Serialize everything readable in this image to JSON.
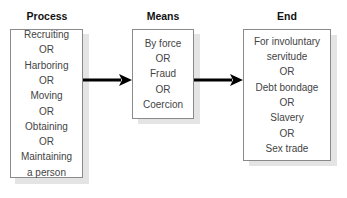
{
  "diagram": {
    "columns": [
      {
        "title": "Process",
        "lines": [
          "Recruiting",
          "OR",
          "Harboring",
          "OR",
          "Moving",
          "OR",
          "Obtaining",
          "OR",
          "Maintaining",
          "a person"
        ]
      },
      {
        "title": "Means",
        "lines": [
          "By force",
          "OR",
          "Fraud",
          "OR",
          "Coercion"
        ]
      },
      {
        "title": "End",
        "lines": [
          "For involuntary",
          "servitude",
          "OR",
          "Debt bondage",
          "OR",
          "Slavery",
          "OR",
          "Sex trade"
        ]
      }
    ],
    "arrows": [
      {
        "from": "Process",
        "to": "Means"
      },
      {
        "from": "Means",
        "to": "End"
      }
    ]
  }
}
